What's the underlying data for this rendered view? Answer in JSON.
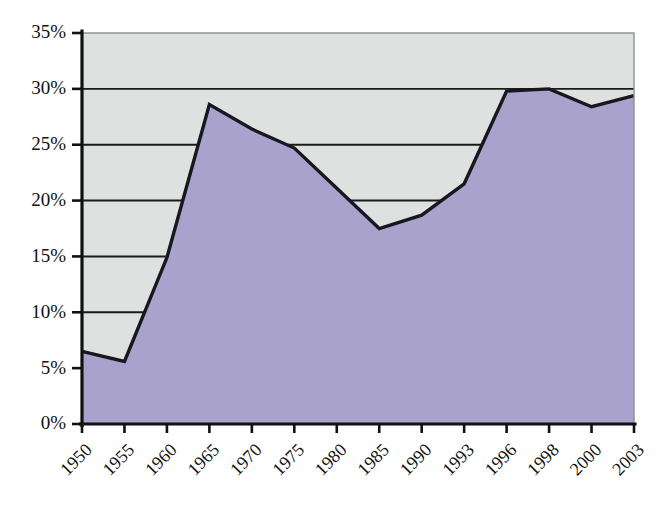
{
  "chart_data": {
    "type": "area",
    "title": "",
    "subtitle": "",
    "xlabel": "",
    "ylabel": "",
    "categories": [
      "1950",
      "1955",
      "1960",
      "1965",
      "1970",
      "1975",
      "1980",
      "1985",
      "1990",
      "1993",
      "1996",
      "1998",
      "2000",
      "2003"
    ],
    "values": [
      6.5,
      5.6,
      14.9,
      28.6,
      26.4,
      24.7,
      21.1,
      17.5,
      18.7,
      21.5,
      29.8,
      30.0,
      28.4,
      29.4
    ],
    "series": [
      {
        "name": "Share",
        "values": [
          6.5,
          5.6,
          14.9,
          28.6,
          26.4,
          24.7,
          21.1,
          17.5,
          18.7,
          21.5,
          29.8,
          30.0,
          28.4,
          29.4
        ]
      }
    ],
    "ylim": [
      0,
      35
    ],
    "ytick_values": [
      0,
      5,
      10,
      15,
      20,
      25,
      30,
      35
    ],
    "ytick_labels": [
      "0%",
      "5%",
      "10%",
      "15%",
      "20%",
      "25%",
      "30%",
      "35%"
    ],
    "xtick_labels": [
      "1950",
      "1955",
      "1960",
      "1965",
      "1970",
      "1975",
      "1980",
      "1985",
      "1990",
      "1993",
      "1996",
      "1998",
      "2000",
      "2003"
    ],
    "grid": "horizontal",
    "legend": "none",
    "colors": {
      "area_fill": "#a9a2cc",
      "line": "#17171f",
      "plot_background": "#dfe1e1",
      "axis": "#111111",
      "gridline": "#1a1a1a",
      "page_background": "#ffffff"
    },
    "annotations": []
  }
}
